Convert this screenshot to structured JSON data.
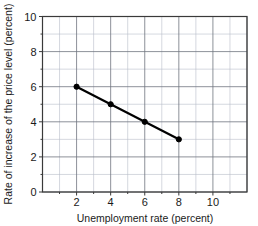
{
  "chart_data": {
    "type": "line",
    "title": "",
    "xlabel": "Unemployment rate (percent)",
    "ylabel": "Rate of increase of the price level (percent)",
    "xlim": [
      0,
      12
    ],
    "ylim": [
      0,
      10
    ],
    "xticks": [
      "2",
      "4",
      "6",
      "8",
      "10"
    ],
    "xtick_values": [
      2,
      4,
      6,
      8,
      10
    ],
    "yticks": [
      "0",
      "2",
      "4",
      "6",
      "8",
      "10"
    ],
    "ytick_values": [
      0,
      2,
      4,
      6,
      8,
      10
    ],
    "grid": true,
    "grid_minor_step": 1,
    "grid_major_step": 2,
    "legend": false,
    "legend_position": "none",
    "series": [
      {
        "name": "Phillips curve",
        "color": "#000000",
        "marker": "circle",
        "x": [
          2,
          4,
          6,
          8
        ],
        "values": [
          6,
          5,
          4,
          3
        ],
        "points": [
          {
            "x": 2,
            "y": 6
          },
          {
            "x": 4,
            "y": 5
          },
          {
            "x": 6,
            "y": 4
          },
          {
            "x": 8,
            "y": 3
          }
        ]
      }
    ]
  },
  "colors": {
    "background": "#ffffff",
    "line": "#000000",
    "grid_minor": "#b9bdc9",
    "grid_major": "#70757f",
    "frame": "#3a3a3a",
    "text": "#1a1a1a"
  }
}
